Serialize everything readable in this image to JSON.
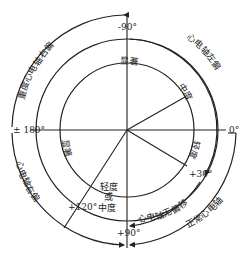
{
  "diagram": {
    "center": {
      "x": 127,
      "y": 130
    },
    "radii": {
      "inner": 67,
      "middle": 91,
      "outer": 115
    },
    "colors": {
      "line": "#222222",
      "background": "#ffffff"
    },
    "angle_labels": {
      "minus90": "-90°",
      "zero": "0°",
      "plus30": "+30°",
      "plus90": "+90°",
      "plus120": "+120°",
      "pm180": "± 180°"
    },
    "inner_labels": {
      "marked_upper": "显著",
      "moderate": "中度",
      "mild_right": "轻度",
      "marked_left": "显著",
      "mild_or_moderate_1": "轻度",
      "mild_or_moderate_2": "或",
      "mild_or_moderate_3": "中度"
    },
    "outer_labels": {
      "severe_right_deviation": "重度心电轴右偏",
      "left_deviation": "心电轴左偏",
      "right_deviation": "心电轴右偏",
      "no_deviation": "心电轴无偏移",
      "normal_axis": "正常心电轴"
    }
  }
}
